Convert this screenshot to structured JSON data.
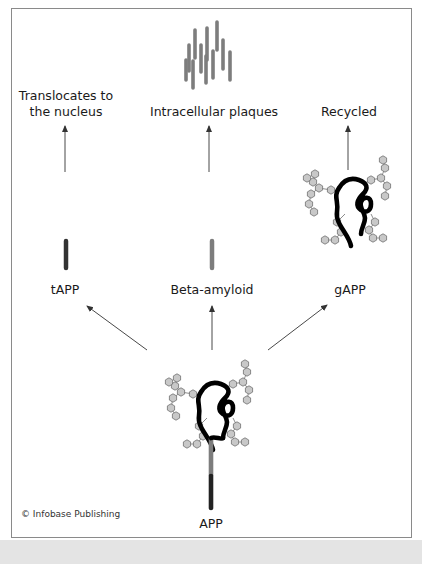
{
  "figure": {
    "credit": "© Infobase Publishing",
    "colors": {
      "frame_border": "#8a8a8a",
      "bottom_band": "#e4e4e4",
      "protein_chain": "#000000",
      "tapp_fragment": "#333333",
      "beta_amyloid": "#7d7d7d",
      "sugar_node_fill": "#c8c8c8",
      "sugar_node_stroke": "#707070",
      "arrow": "#333333"
    }
  },
  "nodes": {
    "app": {
      "label": "APP"
    },
    "tapp": {
      "label": "tAPP"
    },
    "beta_amyloid": {
      "label": "Beta-amyloid"
    },
    "gapp": {
      "label": "gAPP"
    },
    "nucleus": {
      "label_line1": "Translocates to",
      "label_line2": "the nucleus"
    },
    "plaques": {
      "label": "Intracellular plaques"
    },
    "recycled": {
      "label": "Recycled"
    }
  },
  "edges": [
    {
      "from": "APP",
      "to": "tAPP"
    },
    {
      "from": "APP",
      "to": "Beta-amyloid"
    },
    {
      "from": "APP",
      "to": "gAPP"
    },
    {
      "from": "tAPP",
      "to": "Translocates to the nucleus"
    },
    {
      "from": "Beta-amyloid",
      "to": "Intracellular plaques"
    },
    {
      "from": "gAPP",
      "to": "Recycled"
    }
  ]
}
